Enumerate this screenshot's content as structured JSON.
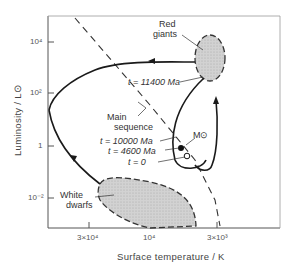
{
  "diagram": {
    "type": "Hertzsprung-Russell evolutionary track of the Sun",
    "y_axis": {
      "title": "Luminosity / L⊙",
      "ticks": [
        "10⁴",
        "10²",
        "1",
        "10⁻²"
      ]
    },
    "x_axis": {
      "title": "Surface temperature / K",
      "ticks": [
        "3×10⁴",
        "10⁴",
        "3×10³"
      ]
    },
    "regions": {
      "red_giants": {
        "line1": "Red",
        "line2": "giants"
      },
      "white_dwarfs": {
        "line1": "White",
        "line2": "dwarfs"
      },
      "main_sequence": {
        "line1": "Main",
        "line2": "sequence"
      }
    },
    "annotations": {
      "t_11400": "t = 11400 Ma",
      "t_10000": "t = 10000 Ma",
      "t_4600": "t = 4600 Ma",
      "t_0": "t = 0",
      "sun_mass": "M⊙"
    },
    "colors": {
      "line": "#1a1a1a",
      "region_fill": "#c8c8c8",
      "axis": "#555555"
    }
  }
}
